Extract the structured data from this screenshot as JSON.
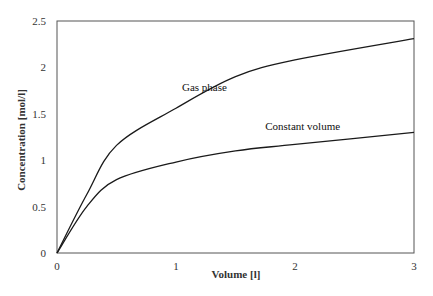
{
  "chart_data": {
    "type": "line",
    "title": "",
    "xlabel": "Volume [l]",
    "ylabel": "Concentration [mol/l]",
    "xlim": [
      0,
      3
    ],
    "ylim": [
      0,
      2.5
    ],
    "x_ticks": [
      "0",
      "1",
      "2",
      "3"
    ],
    "y_ticks": [
      "0",
      "0.5",
      "1",
      "1.5",
      "2",
      "2.5"
    ],
    "grid": false,
    "legend": "none (inline annotations)",
    "x": [
      0,
      0.25,
      0.5,
      1,
      1.5,
      2,
      3
    ],
    "series": [
      {
        "name": "Gas phase",
        "values": [
          0,
          0.63,
          1.16,
          1.56,
          1.9,
          2.08,
          2.31
        ]
      },
      {
        "name": "Constant volume",
        "values": [
          0,
          0.5,
          0.79,
          0.98,
          1.1,
          1.17,
          1.3
        ]
      }
    ],
    "annotations": [
      {
        "text": "Gas phase",
        "x": 1.05,
        "y": 1.75
      },
      {
        "text": "Constant volume",
        "x": 1.75,
        "y": 1.33
      }
    ]
  },
  "colors": {
    "line": "#1a1a1a",
    "axis": "#555555"
  }
}
